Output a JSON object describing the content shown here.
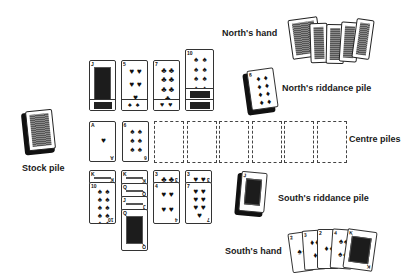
{
  "labels": {
    "norths_hand": "North's hand",
    "norths_riddance": "North's riddance pile",
    "centre_piles": "Centre piles",
    "stock_pile": "Stock pile",
    "souths_riddance": "South's riddance pile",
    "souths_hand": "South's hand"
  },
  "north_hand": {
    "face_down_count": 5
  },
  "north_riddance_top": {
    "rank": "8",
    "suit": "diamonds",
    "pip": "♦"
  },
  "south_riddance_top": {
    "rank": "J",
    "suit": "clubs",
    "face": true
  },
  "stock_pile": {
    "face_down": true
  },
  "north_columns": [
    {
      "cards": [
        {
          "rank": "J",
          "face": true
        },
        {
          "rank": "J",
          "face": true,
          "overlap": true
        }
      ]
    },
    {
      "cards": [
        {
          "rank": "5",
          "suit": "hearts",
          "pip": "♥"
        },
        {
          "rank": "3",
          "suit": "spades",
          "pip": "♠",
          "overlap": true
        }
      ]
    },
    {
      "cards": [
        {
          "rank": "7",
          "suit": "clubs",
          "pip": "♣"
        },
        {
          "rank": "2",
          "suit": "hearts",
          "pip": "♥",
          "overlap": true
        }
      ]
    },
    {
      "cards": [
        {
          "rank": "10",
          "suit": "spades",
          "pip": "♠"
        },
        {
          "rank": "K",
          "face": true,
          "overlap": true
        },
        {
          "rank": "Q",
          "face": true,
          "overlap": true
        }
      ]
    }
  ],
  "centre_piles": [
    {
      "rank": "A",
      "suit": "hearts",
      "pip": "♥"
    },
    {
      "rank": "6",
      "suit": "spades",
      "pip": "♠"
    },
    null,
    null,
    null,
    null,
    null,
    null
  ],
  "south_columns": [
    {
      "cards": [
        {
          "rank": "K",
          "face": true
        },
        {
          "rank": "10",
          "suit": "spades",
          "pip": "♠"
        }
      ]
    },
    {
      "cards": [
        {
          "rank": "K",
          "face": true
        },
        {
          "rank": "Q",
          "face": true
        },
        {
          "rank": "J",
          "face": true
        },
        {
          "rank": "Q",
          "face": true
        }
      ]
    },
    {
      "cards": [
        {
          "rank": "3",
          "suit": "clubs",
          "pip": "♣"
        },
        {
          "rank": "4",
          "suit": "hearts",
          "pip": "♥"
        }
      ]
    },
    {
      "cards": [
        {
          "rank": "3",
          "suit": "hearts",
          "pip": "♥"
        },
        {
          "rank": "7",
          "suit": "hearts",
          "pip": "♥"
        }
      ]
    }
  ],
  "south_hand": [
    {
      "rank": "2",
      "suit": "spades",
      "pip": "♠"
    },
    {
      "rank": "3",
      "suit": "diamonds",
      "pip": "♦"
    },
    {
      "rank": "2",
      "suit": "diamonds",
      "pip": "♦"
    },
    {
      "rank": "4",
      "suit": "spades",
      "pip": "♠"
    },
    {
      "rank": "K",
      "suit": "clubs",
      "face": true
    }
  ]
}
